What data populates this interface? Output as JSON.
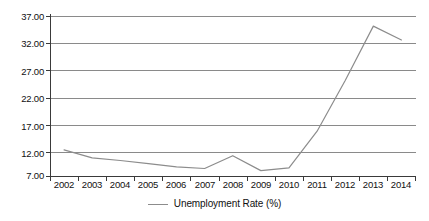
{
  "chart_data": {
    "type": "line",
    "title": "",
    "subtitle": "",
    "xlabel": "",
    "ylabel": "",
    "categories": [
      "2002",
      "2003",
      "2004",
      "2005",
      "2006",
      "2007",
      "2008",
      "2009",
      "2010",
      "2011",
      "2012",
      "2013",
      "2014"
    ],
    "x_tick_labels": [
      "2002",
      "2003",
      "2004",
      "2005",
      "2006",
      "2007",
      "2008",
      "2009",
      "2010",
      "2011",
      "2012",
      "2013",
      "2014"
    ],
    "y_tick_labels": [
      "7.00",
      "12.00",
      "17.00",
      "22.00",
      "27.00",
      "32.00",
      "37.00"
    ],
    "y_tick_values": [
      7,
      12,
      17,
      22,
      27,
      32,
      37
    ],
    "ylim": [
      7,
      37
    ],
    "grid": "horizontal",
    "legend_position": "bottom-center",
    "series": [
      {
        "name": "Unemployment Rate (%)",
        "color": "#8c8c8c",
        "values": [
          12.0,
          10.5,
          10.0,
          9.4,
          8.8,
          8.5,
          10.9,
          8.1,
          8.6,
          15.5,
          25.0,
          35.2,
          32.6
        ]
      }
    ]
  },
  "legend": {
    "entries": [
      {
        "label": "Unemployment Rate (%)"
      }
    ]
  },
  "axes": {
    "y_axis_name": "y-axis",
    "x_axis_name": "x-axis"
  }
}
